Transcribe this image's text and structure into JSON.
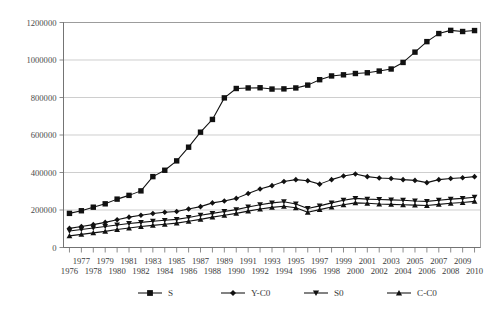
{
  "chart_data": {
    "type": "line",
    "title": "",
    "subtitle": "",
    "xlabel": "",
    "ylabel": "",
    "grid": true,
    "legend_position": "bottom",
    "ylim": [
      0,
      1200000
    ],
    "ytick_labels": [
      "0",
      "200000",
      "400000",
      "600000",
      "800000",
      "1000000",
      "1200000"
    ],
    "ytick_values": [
      0,
      200000,
      400000,
      600000,
      800000,
      1000000,
      1200000
    ],
    "categories": [
      "1976",
      "1977",
      "1978",
      "1979",
      "1980",
      "1981",
      "1982",
      "1983",
      "1984",
      "1985",
      "1986",
      "1987",
      "1988",
      "1989",
      "1990",
      "1991",
      "1992",
      "1993",
      "1994",
      "1995",
      "1996",
      "1997",
      "1998",
      "1999",
      "2000",
      "2001",
      "2002",
      "2003",
      "2004",
      "2005",
      "2006",
      "2007",
      "2008",
      "2009",
      "2010"
    ],
    "xtick_rows": {
      "top": [
        "1977",
        "1979",
        "1981",
        "1983",
        "1985",
        "1987",
        "1989",
        "1991",
        "1993",
        "1995",
        "1997",
        "1999",
        "2001",
        "2003",
        "2005",
        "2007",
        "2009"
      ],
      "bottom": [
        "1976",
        "1978",
        "1980",
        "1982",
        "1984",
        "1986",
        "1988",
        "1990",
        "1992",
        "1994",
        "1996",
        "1998",
        "2000",
        "2002",
        "2004",
        "2006",
        "2008",
        "2010"
      ]
    },
    "series": [
      {
        "name": "S",
        "marker": "square",
        "color": "#111111",
        "values": [
          182000,
          196000,
          215000,
          233000,
          258000,
          278000,
          302000,
          378000,
          412000,
          462000,
          535000,
          615000,
          683000,
          798000,
          848000,
          851000,
          852000,
          845000,
          846000,
          851000,
          866000,
          895000,
          915000,
          921000,
          928000,
          932000,
          941000,
          952000,
          987000,
          1042000,
          1098000,
          1141000,
          1158000,
          1152000,
          1157000
        ]
      },
      {
        "name": "Y-C0",
        "marker": "diamond",
        "color": "#111111",
        "values": [
          102000,
          112000,
          122000,
          134000,
          148000,
          162000,
          172000,
          181000,
          188000,
          192000,
          205000,
          218000,
          238000,
          248000,
          262000,
          288000,
          312000,
          330000,
          352000,
          362000,
          356000,
          338000,
          362000,
          381000,
          392000,
          378000,
          371000,
          368000,
          362000,
          358000,
          346000,
          362000,
          368000,
          372000,
          378000
        ]
      },
      {
        "name": "S0",
        "marker": "triangle-down",
        "color": "#111111",
        "values": [
          88000,
          96000,
          104000,
          112000,
          120000,
          128000,
          134000,
          140000,
          145000,
          150000,
          160000,
          172000,
          182000,
          192000,
          202000,
          216000,
          228000,
          238000,
          244000,
          232000,
          208000,
          222000,
          238000,
          252000,
          262000,
          258000,
          256000,
          254000,
          252000,
          248000,
          246000,
          252000,
          258000,
          262000,
          268000
        ]
      },
      {
        "name": "C-C0",
        "marker": "triangle-up",
        "color": "#111111",
        "values": [
          62000,
          70000,
          78000,
          86000,
          96000,
          104000,
          112000,
          118000,
          124000,
          130000,
          140000,
          150000,
          162000,
          172000,
          182000,
          194000,
          205000,
          214000,
          220000,
          212000,
          188000,
          202000,
          216000,
          228000,
          238000,
          236000,
          232000,
          230000,
          228000,
          226000,
          224000,
          230000,
          236000,
          240000,
          246000
        ]
      }
    ]
  },
  "legend": {
    "items": [
      {
        "label": "S",
        "marker": "square"
      },
      {
        "label": "Y-C0",
        "marker": "diamond"
      },
      {
        "label": "S0",
        "marker": "triangle-down"
      },
      {
        "label": "C-C0",
        "marker": "triangle-up"
      }
    ]
  }
}
